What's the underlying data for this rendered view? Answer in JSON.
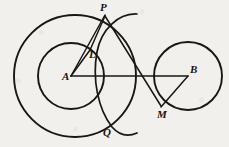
{
  "figure": {
    "background_color": "#f2f0ec",
    "ink_color": "#1a1713",
    "width": 229,
    "height": 147
  },
  "circles": [
    {
      "name": "outer-circle-A",
      "label": "large circle centered at A",
      "cx": 75,
      "cy": 76,
      "r": 61,
      "stroke_width": 1.9
    },
    {
      "name": "inner-circle-A",
      "label": "small circle centered at A",
      "cx": 71,
      "cy": 76,
      "r": 33,
      "stroke_width": 1.9
    },
    {
      "name": "circle-B",
      "label": "circle centered at B",
      "cx": 188,
      "cy": 76,
      "r": 34,
      "stroke_width": 1.9
    }
  ],
  "arcs": [
    {
      "name": "arc-PQ",
      "label": "construction arc through P and Q",
      "path": "M 137 14 C 118 13 101 30 97 52 C 92 79 98 109 112 127 C 119 135 128 137 137 133",
      "stroke_width": 1.7
    }
  ],
  "segments": [
    {
      "name": "segment-A-P",
      "label": "A to P",
      "x1": 71,
      "y1": 76,
      "x2": 105,
      "y2": 15
    },
    {
      "name": "segment-P-M",
      "label": "P to M",
      "x1": 105,
      "y1": 16,
      "x2": 161,
      "y2": 106
    },
    {
      "name": "segment-A-B",
      "label": "A to B",
      "x1": 71,
      "y1": 76,
      "x2": 188,
      "y2": 76
    },
    {
      "name": "segment-B-M",
      "label": "B to M",
      "x1": 188,
      "y1": 76,
      "x2": 161,
      "y2": 107
    },
    {
      "name": "segment-A-L",
      "label": "A to L",
      "x1": 71,
      "y1": 76,
      "x2": 90,
      "y2": 50
    },
    {
      "name": "segment-L-P",
      "label": "L to P",
      "x1": 90,
      "y1": 50,
      "x2": 105,
      "y2": 16
    }
  ],
  "points": [
    {
      "name": "point-P",
      "label": "P",
      "x": 105,
      "y": 15,
      "label_x": 100,
      "label_y": 11
    },
    {
      "name": "point-L",
      "label": "L",
      "x": 90,
      "y": 50,
      "label_x": 89,
      "label_y": 58
    },
    {
      "name": "point-A",
      "label": "A",
      "x": 71,
      "y": 76,
      "label_x": 62,
      "label_y": 80
    },
    {
      "name": "point-B",
      "label": "B",
      "x": 188,
      "y": 76,
      "label_x": 190,
      "label_y": 73
    },
    {
      "name": "point-M",
      "label": "M",
      "x": 161,
      "y": 107,
      "label_x": 157,
      "label_y": 118
    },
    {
      "name": "point-Q",
      "label": "Q",
      "x": 107,
      "y": 124,
      "label_x": 103,
      "label_y": 136
    }
  ],
  "background_artifacts": [
    {
      "name": "scan-artifact-left",
      "text": "",
      "x": 4,
      "y": 116
    },
    {
      "name": "scan-artifact-right",
      "text": "",
      "x": 150,
      "y": 120
    }
  ]
}
